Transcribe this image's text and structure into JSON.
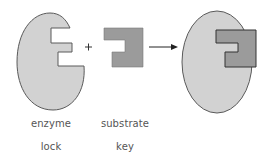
{
  "diagram": {
    "operators": {
      "plus": "+",
      "arrow": "→"
    },
    "colors": {
      "enzyme_fill": "#d2d2d2",
      "substrate_fill": "#9b9b9b",
      "stroke": "#5a5a5a",
      "text": "#555555"
    },
    "nodes": [
      {
        "id": "enzyme",
        "name": "enzyme",
        "role": "lock"
      },
      {
        "id": "substrate",
        "name": "substrate",
        "role": "key"
      },
      {
        "id": "complex",
        "name": "enzyme-substrate complex",
        "role": ""
      }
    ],
    "labels": {
      "enzyme": "enzyme",
      "substrate": "substrate",
      "lock": "lock",
      "key": "key"
    }
  }
}
